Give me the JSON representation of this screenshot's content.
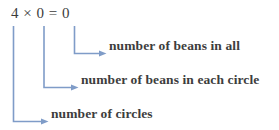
{
  "figure": {
    "equation": "4 × 0 = 0",
    "line_color": "#7f9cc8",
    "text_color": "#3d3d3d",
    "background": "#ffffff",
    "callouts": [
      {
        "id": "product",
        "label": "number of beans in all",
        "source_term": "0",
        "source_role": "product"
      },
      {
        "id": "multiplier",
        "label": "number of beans in each circle",
        "source_term": "0",
        "source_role": "second-factor"
      },
      {
        "id": "multiplicand",
        "label": "number of circles",
        "source_term": "4",
        "source_role": "first-factor"
      }
    ]
  }
}
